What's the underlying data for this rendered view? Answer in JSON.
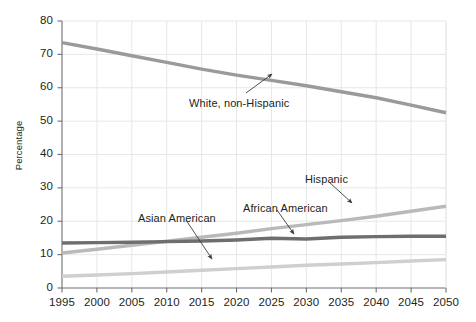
{
  "chart_data": {
    "type": "line",
    "title": "",
    "xlabel": "",
    "ylabel": "Percentage",
    "xlim": [
      1995,
      2050
    ],
    "ylim": [
      0,
      80
    ],
    "grid": true,
    "legend_position": "inline-annotations",
    "x": [
      1995,
      2000,
      2005,
      2010,
      2015,
      2020,
      2025,
      2030,
      2035,
      2040,
      2045,
      2050
    ],
    "yticks": [
      0,
      10,
      20,
      30,
      40,
      50,
      60,
      70,
      80
    ],
    "xticks": [
      "1995",
      "2000",
      "2005",
      "2010",
      "2015",
      "2020",
      "2025",
      "2030",
      "2035",
      "2040",
      "2045",
      "2050"
    ],
    "series": [
      {
        "name": "White, non-Hispanic",
        "color": "#9a9a9a",
        "values": [
          73.5,
          71.6,
          69.6,
          67.6,
          65.6,
          63.8,
          62.2,
          60.6,
          58.8,
          57.0,
          54.8,
          52.5
        ]
      },
      {
        "name": "Hispanic",
        "color": "#b9b9b9",
        "values": [
          10.5,
          11.6,
          12.8,
          14.0,
          15.2,
          16.4,
          17.8,
          19.0,
          20.2,
          21.5,
          23.0,
          24.5
        ]
      },
      {
        "name": "African American",
        "color": "#6e6e6e",
        "values": [
          13.5,
          13.6,
          13.7,
          13.9,
          14.1,
          14.4,
          14.9,
          14.7,
          15.2,
          15.4,
          15.5,
          15.5
        ]
      },
      {
        "name": "Asian American",
        "color": "#cfcfcf",
        "values": [
          3.5,
          3.9,
          4.3,
          4.8,
          5.3,
          5.8,
          6.3,
          6.8,
          7.2,
          7.6,
          8.1,
          8.5
        ]
      }
    ],
    "annotations": [
      {
        "label": "White, non-Hispanic",
        "label_x": 189,
        "label_y": 97,
        "arrow_from_x": 246,
        "arrow_from_y": 93,
        "arrow_to_x": 272,
        "arrow_to_y": 74
      },
      {
        "label": "Asian American",
        "label_x": 138,
        "label_y": 212,
        "arrow_from_x": 186,
        "arrow_from_y": 220,
        "arrow_to_x": 212,
        "arrow_to_y": 259
      },
      {
        "label": "African American",
        "label_x": 243,
        "label_y": 202,
        "arrow_from_x": 277,
        "arrow_from_y": 210,
        "arrow_to_x": 294,
        "arrow_to_y": 234
      },
      {
        "label": "Hispanic",
        "label_x": 305,
        "label_y": 173,
        "arrow_from_x": 329,
        "arrow_from_y": 182,
        "arrow_to_x": 352,
        "arrow_to_y": 203
      }
    ]
  },
  "axis_colors": {
    "axis_line": "#6d6e70",
    "grid_line": "#e6e7e8",
    "text": "#231f20",
    "background": "#ffffff"
  }
}
